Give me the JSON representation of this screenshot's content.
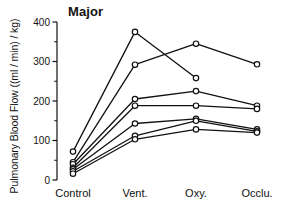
{
  "chart_data": {
    "type": "line",
    "title": "Major",
    "xlabel": "",
    "ylabel": "Pulmonary Blood Flow  ((ml / min) / kg)",
    "categories": [
      "Control",
      "Vent.",
      "Oxy.",
      "Occlu."
    ],
    "ylim": [
      0,
      400
    ],
    "yticks": [
      0,
      100,
      200,
      300,
      400
    ],
    "ytick_labels": [
      "0",
      "100",
      "200",
      "300",
      "400"
    ],
    "yminor_ticks": [
      50,
      150,
      250,
      350
    ],
    "grid": false,
    "legend": "none",
    "marker": "open-circle",
    "line_color": "#111111",
    "series": [
      {
        "name": "subject-1",
        "values": [
          72,
          375,
          258,
          null
        ]
      },
      {
        "name": "subject-2",
        "values": [
          45,
          292,
          345,
          293
        ]
      },
      {
        "name": "subject-3",
        "values": [
          40,
          205,
          225,
          188
        ]
      },
      {
        "name": "subject-4",
        "values": [
          31,
          188,
          188,
          180
        ]
      },
      {
        "name": "subject-5",
        "values": [
          27,
          143,
          155,
          128
        ]
      },
      {
        "name": "subject-6",
        "values": [
          22,
          112,
          150,
          123
        ]
      },
      {
        "name": "subject-7",
        "values": [
          16,
          103,
          128,
          120
        ]
      }
    ]
  },
  "axis": {
    "y_title": "Pulmonary Blood Flow  ((ml / min) / kg)"
  }
}
